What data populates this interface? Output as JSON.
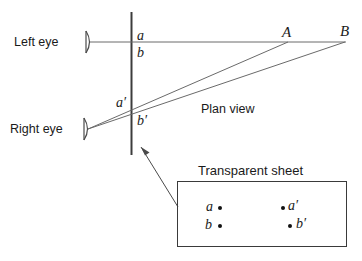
{
  "figure": {
    "caption_plan_view": "Plan view",
    "caption_transparent_sheet": "Transparent  sheet",
    "left_eye_label": "Left eye",
    "right_eye_label": "Right eye",
    "target_a_label": "A",
    "target_b_label": "B",
    "screen_marks": {
      "a": "a",
      "b": "b",
      "a_prime": "a′",
      "b_prime": "b′"
    },
    "sheet_marks": {
      "a": "a",
      "b": "b",
      "a_prime": "a′",
      "b_prime": "b′"
    },
    "colors": {
      "line": "#5a5a5a",
      "screen_line": "#3c3c3c",
      "text": "#1a1a1a",
      "dot": "#111111",
      "background": "#ffffff"
    }
  }
}
